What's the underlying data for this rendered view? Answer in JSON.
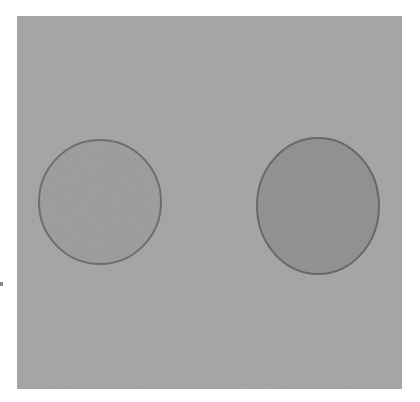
{
  "image": {
    "description": "Photograph of two pencil-shaded circles on grey paper",
    "background_color": "#a7a7a7",
    "shapes": [
      {
        "name": "left-circle",
        "cx": 83,
        "cy": 186,
        "rx": 61,
        "ry": 62,
        "fill": "#a0a0a0",
        "stroke": "#6f6f6f"
      },
      {
        "name": "right-circle",
        "cx": 301,
        "cy": 190,
        "rx": 61,
        "ry": 68,
        "fill": "#939393",
        "stroke": "#6a6a6a"
      }
    ]
  }
}
